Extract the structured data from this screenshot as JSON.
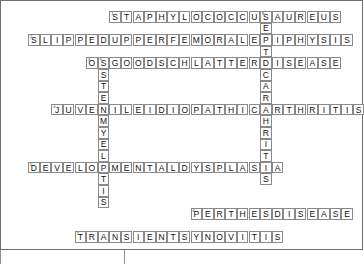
{
  "figure": {
    "type": "crossword-puzzle",
    "background_color": "#ffffff",
    "cell_border_color": "#8a8a8a",
    "frame_color": "#6f6f6f",
    "text_color": "#111111",
    "cell_size": 11.6,
    "origin_x": 16.5,
    "origin_y": 11.0,
    "columns": 30,
    "rows": 21
  },
  "entries": {
    "across": [
      {
        "id": "a1",
        "number": "1",
        "answer": "STAPHYLOCOCCUSAUREUS",
        "letters": [
          "S",
          "T",
          "A",
          "P",
          "H",
          "Y",
          "L",
          "O",
          "C",
          "O",
          "C",
          "C",
          "U",
          "S",
          "A",
          "U",
          "R",
          "E",
          "U",
          "S"
        ],
        "row": 0,
        "col": 8,
        "length": 20
      },
      {
        "id": "a2",
        "number": "2",
        "answer": "SLIPPEDUPPERFEMORALEPIPHYSIS",
        "letters": [
          "S",
          "L",
          "I",
          "P",
          "P",
          "E",
          "D",
          "U",
          "P",
          "P",
          "E",
          "R",
          "F",
          "E",
          "M",
          "O",
          "R",
          "A",
          "L",
          "E",
          "P",
          "I",
          "P",
          "H",
          "Y",
          "S",
          "I",
          "S"
        ],
        "row": 2,
        "col": 1,
        "length": 28
      },
      {
        "id": "a3",
        "number": "3",
        "answer": "OSGOODSCHLATTERDISEASE",
        "letters": [
          "O",
          "S",
          "G",
          "O",
          "O",
          "D",
          "S",
          "C",
          "H",
          "L",
          "A",
          "T",
          "T",
          "E",
          "R",
          "D",
          "I",
          "S",
          "E",
          "A",
          "S",
          "E"
        ],
        "row": 4,
        "col": 6,
        "length": 22
      },
      {
        "id": "a4",
        "number": "4",
        "answer": "JUVENILEIDIOPATHICARTHRITIS",
        "letters": [
          "J",
          "U",
          "V",
          "E",
          "N",
          "I",
          "L",
          "E",
          "I",
          "D",
          "I",
          "O",
          "P",
          "A",
          "T",
          "H",
          "I",
          "C",
          "A",
          "R",
          "T",
          "H",
          "R",
          "I",
          "T",
          "I",
          "S"
        ],
        "row": 8,
        "col": 3,
        "length": 27
      },
      {
        "id": "a5",
        "number": "5",
        "answer": "DEVELOPMENTALDYSPLASIA",
        "letters": [
          "D",
          "E",
          "V",
          "E",
          "L",
          "O",
          "P",
          "M",
          "E",
          "N",
          "T",
          "A",
          "L",
          "D",
          "Y",
          "S",
          "P",
          "L",
          "A",
          "S",
          "I",
          "A"
        ],
        "row": 13,
        "col": 1,
        "length": 22
      },
      {
        "id": "a6",
        "number": "6",
        "answer": "PERTHESDISEASE",
        "letters": [
          "P",
          "E",
          "R",
          "T",
          "H",
          "E",
          "S",
          "D",
          "I",
          "S",
          "E",
          "A",
          "S",
          "E"
        ],
        "row": 17,
        "col": 15,
        "length": 14
      },
      {
        "id": "a7",
        "number": "7",
        "answer": "TRANSIENTSYNOVITIS",
        "letters": [
          "T",
          "R",
          "A",
          "N",
          "S",
          "I",
          "E",
          "N",
          "T",
          "S",
          "Y",
          "N",
          "O",
          "V",
          "I",
          "T",
          "I",
          "S"
        ],
        "row": 19,
        "col": 5,
        "length": 18
      }
    ],
    "down": [
      {
        "id": "d1",
        "number": "8",
        "answer": "SEPTICARTHRITIS",
        "letters": [
          "S",
          "E",
          "P",
          "T",
          "I",
          "C",
          "A",
          "R",
          "T",
          "H",
          "R",
          "I",
          "T",
          "I",
          "S"
        ],
        "row": 0,
        "col": 21,
        "length": 15
      },
      {
        "id": "d2",
        "number": "9",
        "answer": "OSTEOMYELITIS",
        "letters": [
          "O",
          "S",
          "T",
          "E",
          "O",
          "M",
          "Y",
          "E",
          "L",
          "I",
          "T",
          "I",
          "S"
        ],
        "row": 4,
        "col": 7,
        "length": 13
      }
    ]
  }
}
